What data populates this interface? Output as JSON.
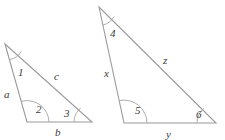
{
  "figure": {
    "background_color": "#ffffff",
    "stroke_color": "#9a9a9a",
    "label_color": "#3a3a3a"
  },
  "triangles": [
    {
      "name": "left-triangle",
      "angle_labels": [
        "1",
        "2",
        "3"
      ],
      "side_labels": [
        "a",
        "b",
        "c"
      ],
      "vertices": {
        "apex": "5,44",
        "bottom_left": "27,122",
        "bottom_right": "92,122"
      }
    },
    {
      "name": "right-triangle",
      "angle_labels": [
        "4",
        "5",
        "6"
      ],
      "side_labels": [
        "x",
        "y",
        "z"
      ],
      "vertices": {
        "apex": "99,7",
        "bottom_left": "124,123",
        "bottom_right": "216,123"
      }
    }
  ],
  "labels": {
    "left": {
      "angle1": "1",
      "angle2": "2",
      "angle3": "3",
      "side_a": "a",
      "side_b": "b",
      "side_c": "c"
    },
    "right": {
      "angle4": "4",
      "angle5": "5",
      "angle6": "6",
      "side_x": "x",
      "side_y": "y",
      "side_z": "z"
    }
  }
}
